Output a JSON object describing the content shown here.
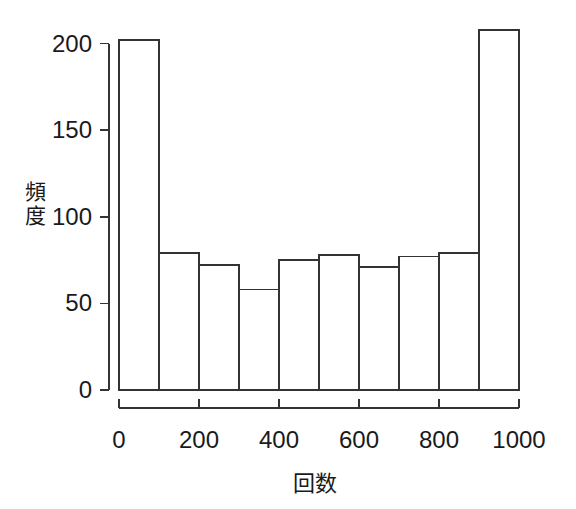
{
  "chart_data": {
    "type": "bar",
    "title": "",
    "subtitle": "",
    "xlabel": "回数",
    "ylabel": "頻度",
    "categories": [
      "0-100",
      "100-200",
      "200-300",
      "300-400",
      "400-500",
      "500-600",
      "600-700",
      "700-800",
      "800-900",
      "900-1000"
    ],
    "bin_edges": [
      0,
      100,
      200,
      300,
      400,
      500,
      600,
      700,
      800,
      900,
      1000
    ],
    "values": [
      202,
      79,
      72,
      58,
      75,
      78,
      71,
      77,
      79,
      208
    ],
    "x": [
      50,
      150,
      250,
      350,
      450,
      550,
      650,
      750,
      850,
      950
    ],
    "xlim": [
      0,
      1000
    ],
    "ylim": [
      0,
      210
    ],
    "xticks": [
      0,
      200,
      400,
      600,
      800,
      1000
    ],
    "yticks": [
      0,
      50,
      100,
      150,
      200
    ],
    "xtick_labels": [
      "0",
      "200",
      "400",
      "600",
      "800",
      "1000"
    ],
    "ytick_labels": [
      "0",
      "50",
      "100",
      "150",
      "200"
    ],
    "grid": false,
    "legend": null,
    "bar_fill_color": "#ffffff",
    "bar_edge_color": "#333333",
    "axis_color": "#333333",
    "background_color": "#ffffff",
    "annotations": []
  }
}
